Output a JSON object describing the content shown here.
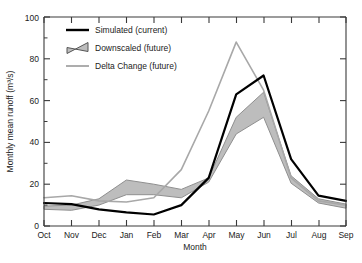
{
  "chart_data": {
    "type": "line",
    "title": "",
    "xlabel": "Month",
    "ylabel": "Monthly mean runoff (m3/s)",
    "ylabel_display": "Monthly mean runoff (m³/s)",
    "categories": [
      "Oct",
      "Nov",
      "Dec",
      "Jan",
      "Feb",
      "Mar",
      "Apr",
      "May",
      "Jun",
      "Jul",
      "Aug",
      "Sep"
    ],
    "xlim": [
      0,
      11
    ],
    "ylim": [
      0,
      100
    ],
    "yticks": [
      0,
      20,
      40,
      60,
      80,
      100
    ],
    "ytick_labels": [
      "0",
      "20",
      "40",
      "60",
      "80",
      "100"
    ],
    "grid": false,
    "legend_position": "upper-left",
    "series": [
      {
        "name": "Simulated (current)",
        "kind": "line",
        "color": "#000000",
        "width": 2.2,
        "values": [
          11,
          10.5,
          8,
          6.5,
          5.5,
          10,
          23,
          63,
          72,
          32,
          14.5,
          12
        ]
      },
      {
        "name": "Downscaled (future)",
        "kind": "band",
        "color": "#b9b9b9",
        "edge_color": "#8f8f8f",
        "upper": [
          9.5,
          10,
          13,
          22,
          20,
          17.5,
          23,
          52,
          64,
          24,
          13,
          10.5
        ],
        "lower": [
          8,
          7.5,
          10,
          15,
          15,
          13.5,
          21,
          44,
          52,
          20.5,
          11,
          8.5
        ]
      },
      {
        "name": "Delta Change (future)",
        "kind": "line",
        "color": "#a8a8a8",
        "width": 1.6,
        "values": [
          13.5,
          14.5,
          12,
          11.5,
          13.5,
          27,
          55,
          88,
          65,
          23,
          12,
          10
        ]
      }
    ],
    "legend_entries": [
      {
        "label": "Simulated (current)",
        "swatch": "black-line"
      },
      {
        "label": "Downscaled (future)",
        "swatch": "gray-band-patch"
      },
      {
        "label": "Delta Change (future)",
        "swatch": "gray-line"
      }
    ]
  },
  "caption": {
    "text": ""
  }
}
